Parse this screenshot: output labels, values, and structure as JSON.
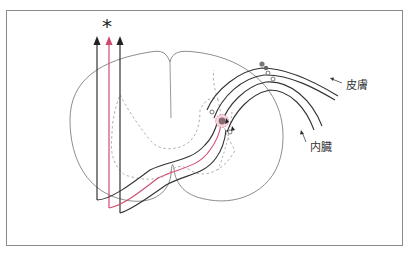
{
  "diagram": {
    "labels": {
      "skin": "皮膚",
      "viscera": "内臓",
      "marker": "*"
    },
    "colors": {
      "frame": "#8a8a8a",
      "outline": "#808080",
      "gray_matter_dashed": "#9a9a9a",
      "fiber": "#333333",
      "highlight_tract": "#d24a6e",
      "synapse_fill": "#8a6a70",
      "synapse_halo": "#e8b4c2"
    },
    "tracts": [
      {
        "name": "left-ascending-tract",
        "color": "#333333"
      },
      {
        "name": "center-ascending-tract",
        "color": "#d24a6e",
        "marked": true
      },
      {
        "name": "right-ascending-tract",
        "color": "#333333"
      }
    ],
    "inputs": [
      {
        "name": "skin-afferent",
        "label": "皮膚"
      },
      {
        "name": "visceral-afferent",
        "label": "内臓"
      }
    ]
  }
}
